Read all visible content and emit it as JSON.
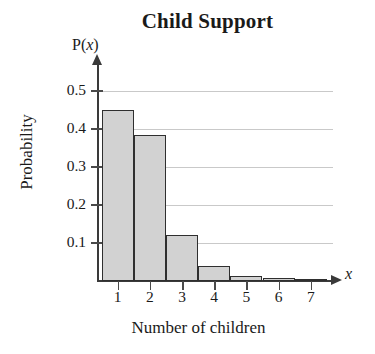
{
  "chart_data": {
    "type": "bar",
    "title": "Child Support",
    "xlabel": "Number of children",
    "ylabel": "Probability",
    "y_axis_symbol": "P(x)",
    "x_axis_symbol": "x",
    "categories": [
      "1",
      "2",
      "3",
      "4",
      "5",
      "6",
      "7"
    ],
    "values": [
      0.45,
      0.385,
      0.12,
      0.04,
      0.012,
      0.008,
      0.003
    ],
    "ytick_labels": [
      "0.1",
      "0.2",
      "0.3",
      "0.4",
      "0.5"
    ],
    "ytick_values": [
      0.1,
      0.2,
      0.3,
      0.4,
      0.5
    ],
    "ylim": [
      0,
      0.55
    ],
    "xlim": [
      0.5,
      7.5
    ],
    "grid": true,
    "legend": false,
    "bar_fill_color": "#d2d2d2",
    "bar_edge_color": "#2f2f2f",
    "gridline_color": "#c9c9c9",
    "axis_color": "#3a3a3a"
  }
}
